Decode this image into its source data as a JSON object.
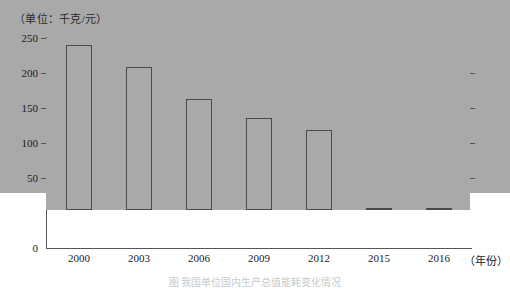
{
  "chart_data": {
    "type": "bar",
    "title": "",
    "unit_label": "（单位：千克/元）",
    "xlabel": "（年份）",
    "ylabel": "",
    "categories": [
      "2000",
      "2003",
      "2006",
      "2009",
      "2012",
      "2015",
      "2016"
    ],
    "values": [
      230,
      205,
      197,
      170,
      132,
      110,
      96
    ],
    "series": [
      {
        "name": "",
        "values": [
          230,
          205,
          197,
          170,
          132,
          110,
          96
        ]
      }
    ],
    "ylim": [
      0,
      250
    ],
    "y_ticks": [
      "0",
      "50",
      "100",
      "150",
      "200",
      "250"
    ],
    "y_tick_values": [
      0,
      50,
      100,
      150,
      200,
      250
    ],
    "grid": true,
    "legend": "none",
    "bar_color": "#a9a9a9",
    "bar_border_color": "#4a4a4a",
    "gridline_color": "#b9b9b9",
    "axis_color": "#555555"
  },
  "caption": {
    "text": "图  我国单位国内生产总值能耗变化情况"
  }
}
